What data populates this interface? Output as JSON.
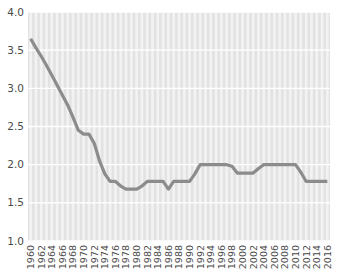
{
  "chart_data": {
    "type": "line",
    "title": "",
    "xlabel": "",
    "ylabel": "",
    "ylim": [
      1.0,
      4.0
    ],
    "xlim": [
      1960,
      2017
    ],
    "grid": true,
    "legend": false,
    "legend_position": "none",
    "line_color": "#8c8c8c",
    "plot_background": "#e2e2e2",
    "band_color": "#f2f2f2",
    "gridline_color": "#ffffff",
    "ytick_labels": [
      "4.0",
      "3.5",
      "3.0",
      "2.5",
      "2.0",
      "1.5",
      "1.0"
    ],
    "ytick_values": [
      4.0,
      3.5,
      3.0,
      2.5,
      2.0,
      1.5,
      1.0
    ],
    "xtick_labels": [
      "1960",
      "1962",
      "1964",
      "1966",
      "1968",
      "1970",
      "1972",
      "1974",
      "1976",
      "1978",
      "1980",
      "1982",
      "1984",
      "1986",
      "1988",
      "1990",
      "1992",
      "1994",
      "1996",
      "1998",
      "2000",
      "2002",
      "2004",
      "2006",
      "2008",
      "2010",
      "2012",
      "2014",
      "2016"
    ],
    "xtick_values": [
      1960,
      1962,
      1964,
      1966,
      1968,
      1970,
      1972,
      1974,
      1976,
      1978,
      1980,
      1982,
      1984,
      1986,
      1988,
      1990,
      1992,
      1994,
      1996,
      1998,
      2000,
      2002,
      2004,
      2006,
      2008,
      2010,
      2012,
      2014,
      2016
    ],
    "x": [
      1960,
      1961,
      1962,
      1963,
      1964,
      1965,
      1966,
      1967,
      1968,
      1969,
      1970,
      1971,
      1972,
      1973,
      1974,
      1975,
      1976,
      1977,
      1978,
      1979,
      1980,
      1981,
      1982,
      1983,
      1984,
      1985,
      1986,
      1987,
      1988,
      1989,
      1990,
      1991,
      1992,
      1993,
      1994,
      1995,
      1996,
      1997,
      1998,
      1999,
      2000,
      2001,
      2002,
      2003,
      2004,
      2005,
      2006,
      2007,
      2008,
      2009,
      2010,
      2011,
      2012,
      2013,
      2014,
      2015,
      2016
    ],
    "values": [
      3.65,
      3.53,
      3.42,
      3.3,
      3.17,
      3.04,
      2.91,
      2.78,
      2.62,
      2.45,
      2.4,
      2.4,
      2.28,
      2.05,
      1.88,
      1.78,
      1.78,
      1.72,
      1.68,
      1.68,
      1.68,
      1.72,
      1.78,
      1.78,
      1.78,
      1.78,
      1.68,
      1.78,
      1.78,
      1.78,
      1.78,
      1.88,
      2.0,
      2.0,
      2.0,
      2.0,
      2.0,
      2.0,
      1.98,
      1.89,
      1.89,
      1.89,
      1.89,
      1.95,
      2.0,
      2.0,
      2.0,
      2.0,
      2.0,
      2.0,
      2.0,
      1.9,
      1.78,
      1.78,
      1.78,
      1.78,
      1.78
    ],
    "series": [
      {
        "name": "value",
        "values": [
          3.65,
          3.53,
          3.42,
          3.3,
          3.17,
          3.04,
          2.91,
          2.78,
          2.62,
          2.45,
          2.4,
          2.4,
          2.28,
          2.05,
          1.88,
          1.78,
          1.78,
          1.72,
          1.68,
          1.68,
          1.68,
          1.72,
          1.78,
          1.78,
          1.78,
          1.78,
          1.68,
          1.78,
          1.78,
          1.78,
          1.78,
          1.88,
          2.0,
          2.0,
          2.0,
          2.0,
          2.0,
          2.0,
          1.98,
          1.89,
          1.89,
          1.89,
          1.89,
          1.95,
          2.0,
          2.0,
          2.0,
          2.0,
          2.0,
          2.0,
          2.0,
          1.9,
          1.78,
          1.78,
          1.78,
          1.78,
          1.78
        ]
      }
    ]
  }
}
